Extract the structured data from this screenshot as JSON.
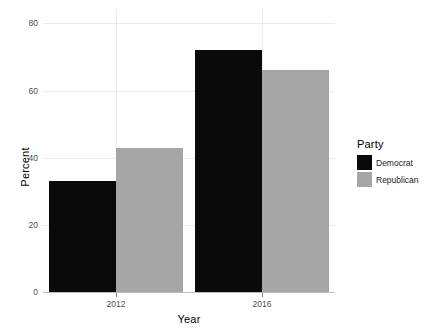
{
  "chart_data": {
    "type": "bar",
    "title": "",
    "categories": [
      "2012",
      "2016"
    ],
    "series": [
      {
        "name": "Democrat",
        "values": [
          33,
          72
        ],
        "color": "#0a0a0a"
      },
      {
        "name": "Republican",
        "values": [
          43,
          66
        ],
        "color": "#a6a6a6"
      }
    ],
    "xlabel": "Year",
    "ylabel": "Percent",
    "ylim": [
      0,
      84
    ],
    "yticks": [
      0,
      20,
      40,
      60,
      80
    ],
    "ytick_labels": [
      "0",
      "20",
      "40",
      "60",
      "80"
    ],
    "xtick_labels": [
      "2012",
      "2016"
    ],
    "grid": true,
    "grid_color": "#ebebeb",
    "background": "#ffffff",
    "legend": {
      "title": "Party",
      "position": "right",
      "entries": [
        {
          "label": "Democrat",
          "color": "#0a0a0a"
        },
        {
          "label": "Republican",
          "color": "#a6a6a6"
        }
      ]
    }
  }
}
